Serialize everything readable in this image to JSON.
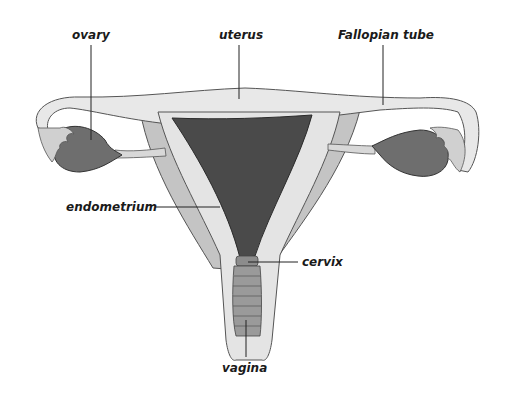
{
  "diagram": {
    "type": "anatomical-illustration",
    "labels": {
      "ovary": "ovary",
      "uterus": "uterus",
      "fallopian_tube": "Fallopian tube",
      "endometrium": "endometrium",
      "cervix": "cervix",
      "vagina": "vagina"
    },
    "colors": {
      "background": "#ffffff",
      "tissue_light": "#e8e8e8",
      "tissue_mid": "#c4c4c4",
      "ovary": "#6e6e6e",
      "endometrium": "#4a4a4a",
      "vagina": "#9a9a9a",
      "outline": "#3a3a3a",
      "leader_line": "#222222"
    }
  }
}
